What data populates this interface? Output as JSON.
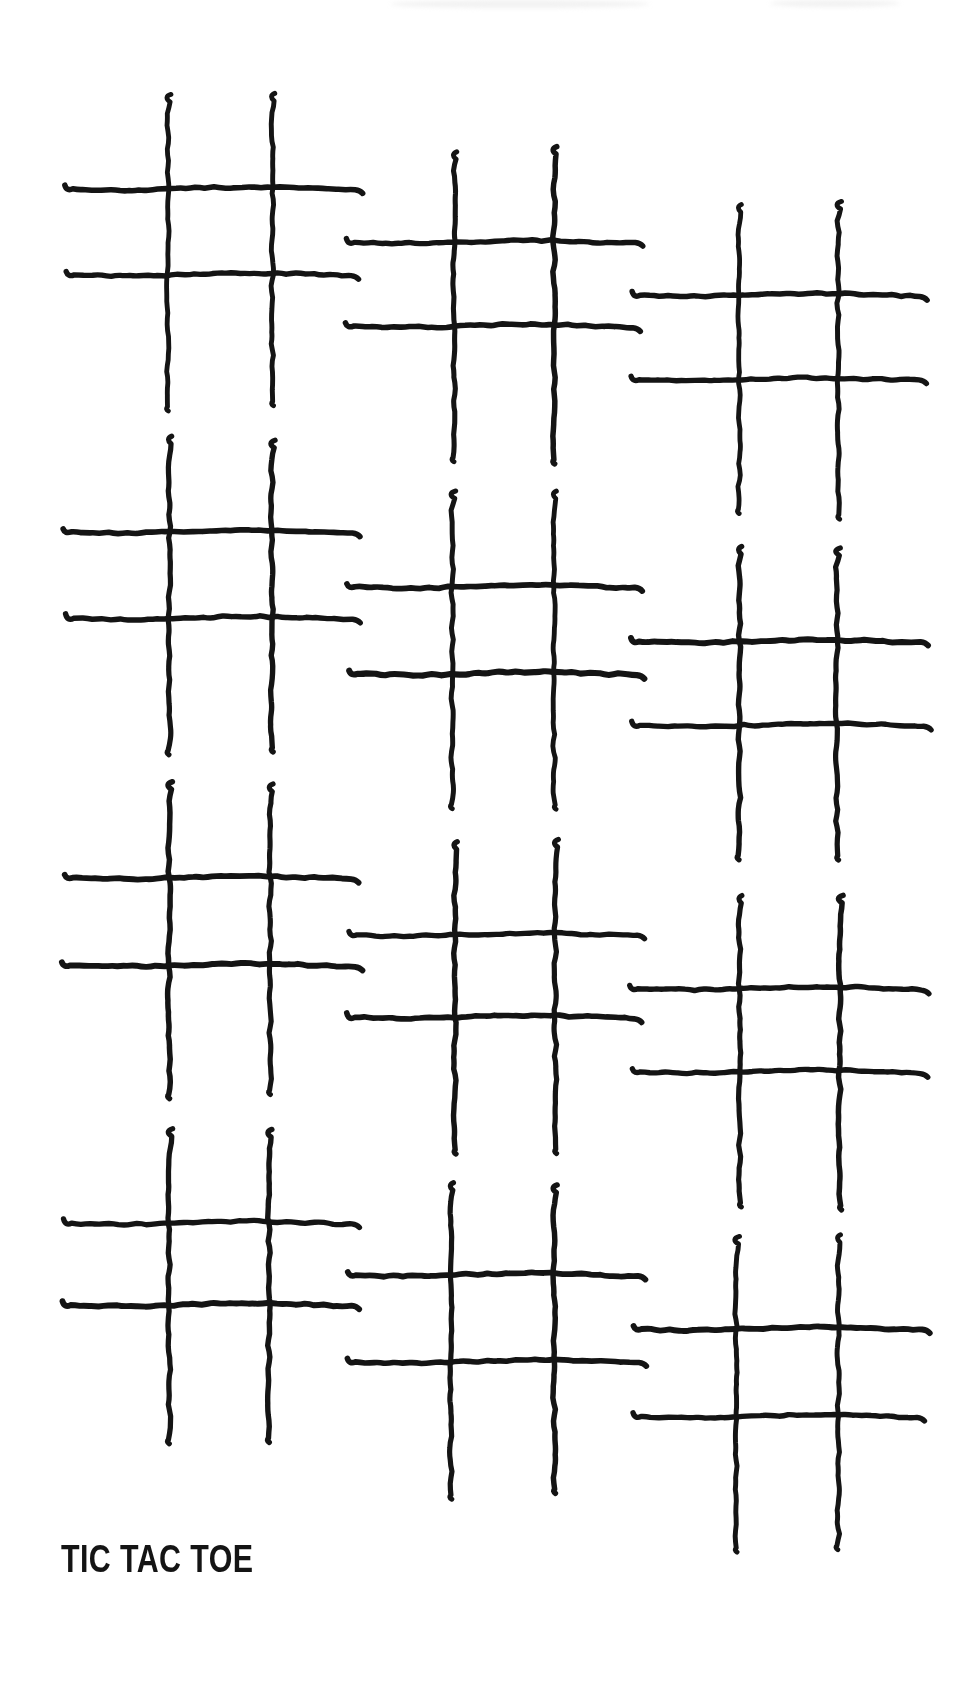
{
  "page": {
    "width": 975,
    "height": 1691,
    "background_color": "#ffffff",
    "ink_color": "#141414",
    "medium": "hand-drawn ink on paper"
  },
  "title": {
    "text": "TIC TAC TOE",
    "color": "#141414",
    "position": "bottom-left"
  },
  "layout": {
    "rows": 4,
    "columns": 3,
    "total_boards": 12,
    "arrangement": "staggered diagonal grid",
    "column_vertical_offsets": [
      0,
      55,
      110
    ],
    "row_spacing": 347
  },
  "boards": [
    {
      "id": "board-1",
      "row": 1,
      "col": 1,
      "label": "tic-tac-toe-grid-1",
      "x": 62,
      "y": 88,
      "w": 272,
      "h": 295,
      "seed": 11
    },
    {
      "id": "board-2",
      "row": 1,
      "col": 2,
      "label": "tic-tac-toe-grid-2",
      "x": 345,
      "y": 143,
      "w": 272,
      "h": 295,
      "seed": 23
    },
    {
      "id": "board-3",
      "row": 1,
      "col": 3,
      "label": "tic-tac-toe-grid-3",
      "x": 630,
      "y": 196,
      "w": 272,
      "h": 295,
      "seed": 37
    },
    {
      "id": "board-4",
      "row": 2,
      "col": 1,
      "label": "tic-tac-toe-grid-4",
      "x": 62,
      "y": 432,
      "w": 272,
      "h": 295,
      "seed": 45
    },
    {
      "id": "board-5",
      "row": 2,
      "col": 2,
      "label": "tic-tac-toe-grid-5",
      "x": 345,
      "y": 487,
      "w": 272,
      "h": 295,
      "seed": 59
    },
    {
      "id": "board-6",
      "row": 2,
      "col": 3,
      "label": "tic-tac-toe-grid-6",
      "x": 630,
      "y": 541,
      "w": 272,
      "h": 295,
      "seed": 67
    },
    {
      "id": "board-7",
      "row": 3,
      "col": 1,
      "label": "tic-tac-toe-grid-7",
      "x": 62,
      "y": 778,
      "w": 272,
      "h": 295,
      "seed": 73
    },
    {
      "id": "board-8",
      "row": 3,
      "col": 2,
      "label": "tic-tac-toe-grid-8",
      "x": 345,
      "y": 833,
      "w": 272,
      "h": 295,
      "seed": 83
    },
    {
      "id": "board-9",
      "row": 3,
      "col": 3,
      "label": "tic-tac-toe-grid-9",
      "x": 630,
      "y": 887,
      "w": 272,
      "h": 295,
      "seed": 97
    },
    {
      "id": "board-10",
      "row": 4,
      "col": 1,
      "label": "tic-tac-toe-grid-10",
      "x": 62,
      "y": 1122,
      "w": 272,
      "h": 295,
      "seed": 103
    },
    {
      "id": "board-11",
      "row": 4,
      "col": 2,
      "label": "tic-tac-toe-grid-11",
      "x": 345,
      "y": 1177,
      "w": 272,
      "h": 295,
      "seed": 113
    },
    {
      "id": "board-12",
      "row": 4,
      "col": 3,
      "label": "tic-tac-toe-grid-12",
      "x": 630,
      "y": 1231,
      "w": 272,
      "h": 295,
      "seed": 127
    }
  ],
  "board_geometry": {
    "vertical_line_xs": [
      0.36,
      0.73
    ],
    "horizontal_line_ys": [
      0.31,
      0.6
    ],
    "stroke_width": 5.2,
    "cells": 9,
    "marks": []
  }
}
